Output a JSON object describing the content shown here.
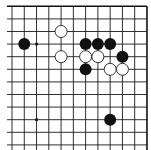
{
  "board": {
    "description": "Go board corner section (top-right edges visible)",
    "columns": 12,
    "rows": 12,
    "grid": {
      "x0": 12,
      "dx": 12.27,
      "y0": 6.3,
      "dy": 12.6,
      "line_left": 7,
      "line_bottom": 150,
      "line_color": "#1a1a1a",
      "edge_color": "#111111"
    },
    "stone_radius": 6,
    "star_points": [
      {
        "col": 2,
        "row": 3
      },
      {
        "col": 2,
        "row": 9
      }
    ],
    "stones": [
      {
        "color": "black",
        "col": 1,
        "row": 3
      },
      {
        "color": "white",
        "col": 4,
        "row": 2
      },
      {
        "color": "white",
        "col": 4,
        "row": 4
      },
      {
        "color": "black",
        "col": 6,
        "row": 3
      },
      {
        "color": "black",
        "col": 7,
        "row": 3
      },
      {
        "color": "black",
        "col": 8,
        "row": 3
      },
      {
        "color": "white",
        "col": 6,
        "row": 4
      },
      {
        "color": "white",
        "col": 7,
        "row": 4
      },
      {
        "color": "black",
        "col": 9,
        "row": 4
      },
      {
        "color": "black",
        "col": 6,
        "row": 5
      },
      {
        "color": "white",
        "col": 8,
        "row": 5
      },
      {
        "color": "white",
        "col": 9,
        "row": 5
      },
      {
        "color": "black",
        "col": 8,
        "row": 9
      }
    ],
    "colors": {
      "black_stone": "#111111",
      "white_stone_fill": "#ffffff",
      "white_stone_stroke": "#222222",
      "background": "#ffffff"
    }
  }
}
